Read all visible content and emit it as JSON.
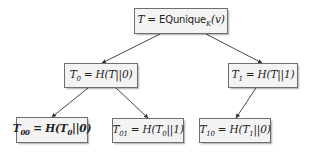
{
  "diagram": {
    "type": "binary-tree",
    "title": "",
    "colors": {
      "node_fill": "#f3f3f3",
      "node_border": "#6f6f6f",
      "edge": "#333333",
      "text": "#222222"
    },
    "nodes": [
      {
        "id": "root",
        "label": "T = EQunique_K(v)",
        "display": {
          "lhs": "T",
          "eq": " = ",
          "func": "EQunique",
          "sub": "K",
          "arg": "(v)"
        },
        "box": [
          134,
          8,
          94,
          26
        ],
        "bold": false
      },
      {
        "id": "T0",
        "label": "T0 = H(T||0)",
        "display": {
          "lhs": "T",
          "lhs_sub": "0",
          "rhs": " = H(T||0)"
        },
        "box": [
          64,
          63,
          74,
          25
        ],
        "bold": false
      },
      {
        "id": "T1",
        "label": "T1 = H(T||1)",
        "display": {
          "lhs": "T",
          "lhs_sub": "1",
          "rhs": " = H(T||1)"
        },
        "box": [
          228,
          63,
          70,
          25
        ],
        "bold": false
      },
      {
        "id": "T00",
        "label": "T00 = H(T0||0)",
        "display": {
          "lhs": "T",
          "lhs_sub": "00",
          "rhs_pre": " = H(T",
          "rhs_sub": "0",
          "rhs_post": "||0)"
        },
        "box": [
          16,
          117,
          72,
          26
        ],
        "bold": true
      },
      {
        "id": "T01",
        "label": "T01 = H(T0||1)",
        "display": {
          "lhs": "T",
          "lhs_sub": "01",
          "rhs_pre": " = H(T",
          "rhs_sub": "0",
          "rhs_post": "||1)"
        },
        "box": [
          112,
          118,
          72,
          25
        ],
        "bold": false
      },
      {
        "id": "T10",
        "label": "T10 = H(T1||0)",
        "display": {
          "lhs": "T",
          "lhs_sub": "10",
          "rhs_pre": " = H(T",
          "rhs_sub": "1",
          "rhs_post": "||0)"
        },
        "box": [
          199,
          118,
          72,
          25
        ],
        "bold": false
      }
    ],
    "edges": [
      {
        "from": "root",
        "to": "T0",
        "points": [
          160,
          34,
          102,
          63
        ]
      },
      {
        "from": "root",
        "to": "T1",
        "points": [
          206,
          34,
          262,
          63
        ]
      },
      {
        "from": "T0",
        "to": "T00",
        "points": [
          88,
          88,
          52,
          117
        ]
      },
      {
        "from": "T0",
        "to": "T01",
        "points": [
          116,
          88,
          148,
          118
        ]
      },
      {
        "from": "T1",
        "to": "T10",
        "points": [
          256,
          88,
          236,
          118
        ]
      }
    ]
  }
}
